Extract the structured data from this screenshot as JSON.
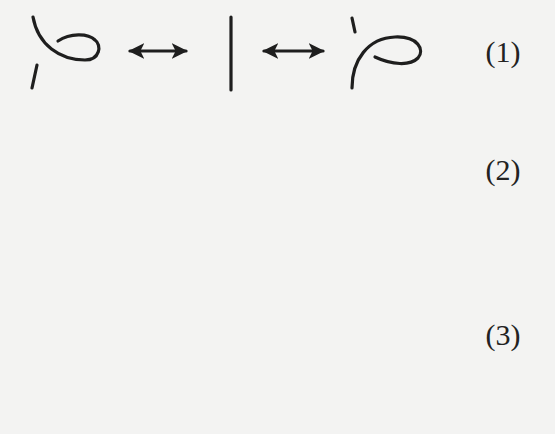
{
  "colors": {
    "ink": "#1e1e1e",
    "paper": "#f3f3f2"
  },
  "moves": [
    {
      "id": 1,
      "label": "(1)",
      "name": "Reidemeister move I (twist / kink)",
      "panels": [
        "left-kink",
        "straight-strand",
        "right-kink"
      ],
      "arrows": 2
    },
    {
      "id": 2,
      "label": "(2)",
      "name": "Reidemeister move II (poke)",
      "panels": [
        "overlapping-arcs-left",
        "separated-arcs",
        "overlapping-arcs-right"
      ],
      "arrows": 2
    },
    {
      "id": 3,
      "label": "(3)",
      "name": "Reidemeister move III (slide)",
      "panels": [
        "strand-above-crossing",
        "strand-below-crossing"
      ],
      "arrows": 1
    }
  ]
}
